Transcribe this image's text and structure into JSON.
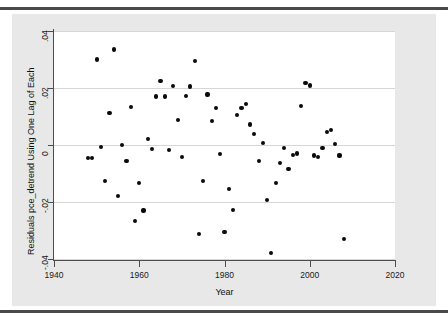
{
  "figure": {
    "background_color": "#e8e8e8",
    "plot_background_color": "#ffffff",
    "marker_color": "#0a0a0a",
    "grid_color": "#d6d6d6",
    "axis_color": "#4d4d4d"
  },
  "chart_data": {
    "type": "scatter",
    "title": "",
    "xlabel": "Year",
    "ylabel": "Residuals pce_detrend Using One Lag of Each",
    "xlim": [
      1940,
      2020
    ],
    "ylim": [
      -0.04,
      0.04
    ],
    "xticks": [
      1940,
      1960,
      1980,
      2000,
      2020
    ],
    "xticklabels": [
      "1940",
      "1960",
      "1980",
      "2000",
      "2020"
    ],
    "yticks": [
      -0.04,
      -0.02,
      0,
      0.02,
      0.04
    ],
    "yticklabels": [
      "-.04",
      "-.02",
      "0",
      ".02",
      ".04"
    ],
    "grid": "horizontal",
    "legend": "none",
    "series": [
      {
        "name": "residuals",
        "x": [
          1948,
          1949,
          1950,
          1951,
          1952,
          1953,
          1954,
          1955,
          1956,
          1957,
          1958,
          1959,
          1960,
          1961,
          1962,
          1963,
          1964,
          1965,
          1966,
          1967,
          1968,
          1969,
          1970,
          1971,
          1972,
          1973,
          1974,
          1975,
          1976,
          1977,
          1978,
          1979,
          1980,
          1981,
          1982,
          1983,
          1984,
          1985,
          1986,
          1987,
          1988,
          1989,
          1990,
          1991,
          1992,
          1993,
          1994,
          1995,
          1996,
          1997,
          1998,
          1999,
          2000,
          2001,
          2002,
          2003,
          2004,
          2005,
          2006,
          2007,
          2008
        ],
        "y": [
          -0.0045,
          -0.0045,
          0.03,
          -0.0008,
          -0.0125,
          0.0113,
          0.0335,
          -0.0178,
          0.0,
          -0.0057,
          0.0133,
          -0.0268,
          -0.0133,
          -0.023,
          0.0022,
          -0.0013,
          0.017,
          0.0225,
          0.017,
          -0.0018,
          0.0207,
          0.0088,
          -0.0042,
          0.0173,
          0.0205,
          0.0296,
          -0.0312,
          -0.0127,
          0.0177,
          0.0085,
          0.0131,
          -0.0031,
          -0.0305,
          -0.0155,
          -0.0228,
          0.0104,
          0.0129,
          0.0145,
          0.0072,
          0.004,
          -0.0057,
          0.0008,
          -0.0192,
          -0.038,
          -0.0133,
          -0.0062,
          -0.001,
          -0.0084,
          -0.0036,
          -0.003,
          0.0136,
          0.0218,
          0.0209,
          -0.0037,
          -0.0041,
          -0.0011,
          0.0045,
          0.0054,
          0.0003,
          -0.0037,
          -0.033
        ]
      }
    ]
  }
}
